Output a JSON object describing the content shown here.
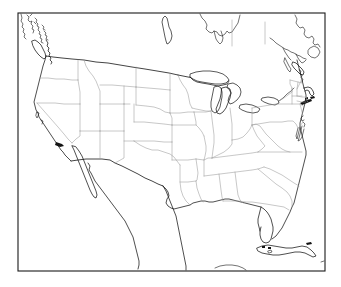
{
  "figure": {
    "type": "map",
    "title": "",
    "background_color": "#ffffff",
    "frame": {
      "visible": true,
      "color": "#1a1a1a",
      "stroke_width": 1.1,
      "x": 18,
      "y": 13,
      "width": 307,
      "height": 258
    },
    "style": {
      "coastline_color": "#141414",
      "national_border_color": "#141414",
      "state_border_color": "#9a9a9a",
      "land_fill": "#ffffff",
      "water_fill": "#ffffff"
    },
    "projection": "lambert-conformal-conic",
    "labels": [],
    "legend": {
      "visible": false,
      "entries": []
    },
    "axes": {
      "visible": false,
      "x_ticks": [],
      "y_ticks": []
    },
    "regions": [
      {
        "name": "contiguous-united-states",
        "type": "country",
        "boundaries": "state"
      },
      {
        "name": "canada",
        "type": "country",
        "boundaries": "province-partial"
      },
      {
        "name": "mexico",
        "type": "country",
        "boundaries": "none"
      },
      {
        "name": "cuba",
        "type": "country",
        "boundaries": "none"
      },
      {
        "name": "great-lakes",
        "type": "water",
        "lakes": [
          "Superior",
          "Michigan",
          "Huron",
          "Erie",
          "Ontario"
        ]
      },
      {
        "name": "lake-winnipeg",
        "type": "water"
      },
      {
        "name": "vancouver-island",
        "type": "island"
      },
      {
        "name": "baja-california",
        "type": "peninsula"
      },
      {
        "name": "florida-keys",
        "type": "island-chain"
      },
      {
        "name": "long-island",
        "type": "island"
      },
      {
        "name": "cape-cod",
        "type": "peninsula"
      },
      {
        "name": "chesapeake-bay",
        "type": "water"
      }
    ]
  }
}
